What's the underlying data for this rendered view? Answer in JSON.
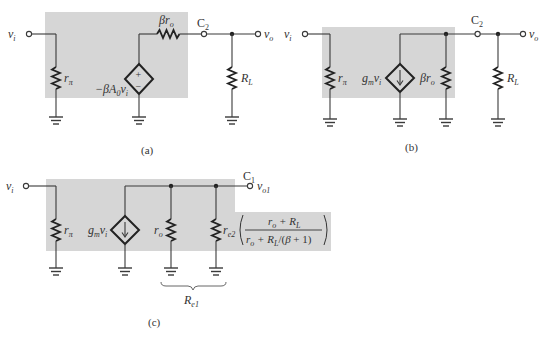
{
  "figure": {
    "panels": [
      {
        "id": "a",
        "caption": "(a)",
        "input_label": "v",
        "input_sub": "i",
        "rpi_label": "r",
        "rpi_sub": "π",
        "source_label": "−βA",
        "source_label_sub": "0",
        "source_label_tail": "v",
        "source_label_tail_sub": "i",
        "source_type": "voltage",
        "source_plus": "+",
        "source_minus": "−",
        "series_res_label": "βr",
        "series_res_sub": "o",
        "cap_label": "C",
        "cap_sub": "2",
        "load_label": "R",
        "load_sub": "L",
        "output_label": "v",
        "output_sub": "o"
      },
      {
        "id": "b",
        "caption": "(b)",
        "input_label": "v",
        "input_sub": "i",
        "rpi_label": "r",
        "rpi_sub": "π",
        "source_label": "g",
        "source_label_sub": "m",
        "source_label_tail": "v",
        "source_label_tail_sub": "i",
        "source_type": "current",
        "shunt_res_label": "βr",
        "shunt_res_sub": "o",
        "cap_label": "C",
        "cap_sub": "2",
        "load_label": "R",
        "load_sub": "L",
        "output_label": "v",
        "output_sub": "o"
      },
      {
        "id": "c",
        "caption": "(c)",
        "input_label": "v",
        "input_sub": "i",
        "rpi_label": "r",
        "rpi_sub": "π",
        "source_label": "g",
        "source_label_sub": "m",
        "source_label_tail": "v",
        "source_label_tail_sub": "i",
        "source_type": "current",
        "ro_label": "r",
        "ro_sub": "o",
        "re2_label": "r",
        "re2_sub": "e2",
        "re2_factor_numerator": "r_o + R_L",
        "re2_factor_denominator": "r_o + R_L/(β + 1)",
        "cap_label": "C",
        "cap_sub": "1",
        "output_label": "v",
        "output_sub": "o1",
        "brace_label": "R",
        "brace_sub": "e1"
      }
    ]
  },
  "colors": {
    "shading": "#d6d6d6",
    "ink": "#222222",
    "wire": "#3a3a3a"
  }
}
